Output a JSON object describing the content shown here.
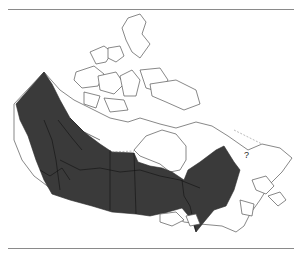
{
  "map": {
    "subject": "Canada",
    "shading": {
      "range_color": "#3a3a3a",
      "land_fill": "#ffffff",
      "outline_color": "#555555"
    },
    "annotations": [
      {
        "id": "uncertain-labrador",
        "text": "?"
      }
    ]
  }
}
